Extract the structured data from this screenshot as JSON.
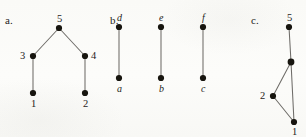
{
  "figure": {
    "background_color": "#fdfdfb",
    "edge_color": "#6e6c68",
    "vertex_color": "#17150f",
    "text_color": "#1f1d1b"
  },
  "panels": [
    {
      "marker": "a.",
      "marker_x": 5,
      "marker_y": 14,
      "vertices": [
        {
          "id": "a5",
          "label": "5",
          "x": 59,
          "y": 28,
          "r": 3.1,
          "label_dx": -2,
          "label_dy": -14,
          "italic": false
        },
        {
          "id": "a3",
          "label": "3",
          "x": 33,
          "y": 56,
          "r": 3.1,
          "label_dx": -13,
          "label_dy": -5,
          "italic": false
        },
        {
          "id": "a4",
          "label": "4",
          "x": 85,
          "y": 56,
          "r": 3.1,
          "label_dx": 6,
          "label_dy": -5,
          "italic": false
        },
        {
          "id": "a1",
          "label": "1",
          "x": 33,
          "y": 93,
          "r": 3.1,
          "label_dx": -2,
          "label_dy": 6,
          "italic": false
        },
        {
          "id": "a2",
          "label": "2",
          "x": 85,
          "y": 93,
          "r": 3.1,
          "label_dx": -2,
          "label_dy": 6,
          "italic": false
        }
      ],
      "edges": [
        {
          "from": "a3",
          "to": "a5"
        },
        {
          "from": "a4",
          "to": "a5"
        },
        {
          "from": "a1",
          "to": "a3"
        },
        {
          "from": "a2",
          "to": "a4"
        }
      ]
    },
    {
      "marker": "b.",
      "marker_x": 110,
      "marker_y": 14,
      "vertices": [
        {
          "id": "bd",
          "label": "d",
          "x": 119,
          "y": 27,
          "r": 3.1,
          "label_dx": -2,
          "label_dy": -14,
          "italic": true
        },
        {
          "id": "ba",
          "label": "a",
          "x": 119,
          "y": 78,
          "r": 3.1,
          "label_dx": -2,
          "label_dy": 6,
          "italic": true
        },
        {
          "id": "be",
          "label": "e",
          "x": 161,
          "y": 27,
          "r": 3.1,
          "label_dx": -2,
          "label_dy": -14,
          "italic": true
        },
        {
          "id": "bb",
          "label": "b",
          "x": 161,
          "y": 78,
          "r": 3.1,
          "label_dx": -2,
          "label_dy": 6,
          "italic": true
        },
        {
          "id": "bf",
          "label": "f",
          "x": 203,
          "y": 27,
          "r": 3.1,
          "label_dx": -1,
          "label_dy": -14,
          "italic": true
        },
        {
          "id": "bc",
          "label": "c",
          "x": 203,
          "y": 78,
          "r": 3.1,
          "label_dx": -2,
          "label_dy": 6,
          "italic": true
        }
      ],
      "edges": [
        {
          "from": "ba",
          "to": "bd"
        },
        {
          "from": "bb",
          "to": "be"
        },
        {
          "from": "bc",
          "to": "bf"
        }
      ]
    },
    {
      "marker": "c.",
      "marker_x": 251,
      "marker_y": 14,
      "clipped_right_edge": true,
      "vertices": [
        {
          "id": "c5",
          "label": "5",
          "x": 289,
          "y": 27,
          "r": 3.1,
          "label_dx": -2,
          "label_dy": -14,
          "italic": false
        },
        {
          "id": "cj",
          "label": "",
          "x": 291,
          "y": 62,
          "r": 3.4,
          "label_dx": 0,
          "label_dy": 0,
          "italic": false
        },
        {
          "id": "c2",
          "label": "2",
          "x": 273,
          "y": 96,
          "r": 3.1,
          "label_dx": -13,
          "label_dy": -5,
          "italic": false
        },
        {
          "id": "c1",
          "label": "1",
          "x": 294,
          "y": 122,
          "r": 3.1,
          "label_dx": -2,
          "label_dy": 5,
          "italic": false
        }
      ],
      "edges": [
        {
          "from": "cj",
          "to": "c5"
        },
        {
          "from": "c2",
          "to": "cj"
        },
        {
          "from": "c1",
          "to": "c2"
        },
        {
          "from": "c1",
          "to": "cj"
        }
      ]
    }
  ]
}
